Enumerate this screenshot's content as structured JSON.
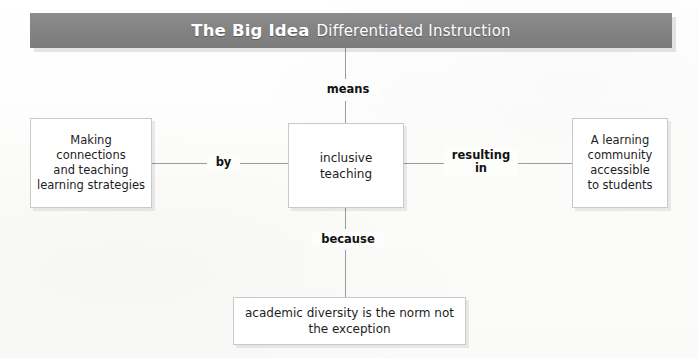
{
  "header": {
    "title_strong": "The Big Idea",
    "title_light": "Differentiated Instruction"
  },
  "nodes": {
    "center": {
      "label": "inclusive\nteaching"
    },
    "left": {
      "label": "Making\nconnections\nand teaching\nlearning strategies"
    },
    "right": {
      "label": "A learning\ncommunity\naccessible\nto students"
    },
    "bottom": {
      "label": "academic diversity is the norm not\nthe exception"
    }
  },
  "edges": {
    "means": {
      "label": "means"
    },
    "by": {
      "label": "by"
    },
    "resulting_in": {
      "label": "resulting\nin"
    },
    "because": {
      "label": "because"
    }
  },
  "colors": {
    "banner_fill": "#848484",
    "banner_text": "#ffffff",
    "node_fill": "#ffffff",
    "node_border": "#c9c9c9",
    "connector_line": "#9b9b9b",
    "body_text": "#1d1d1d",
    "page_background": "#fdfdfc"
  }
}
